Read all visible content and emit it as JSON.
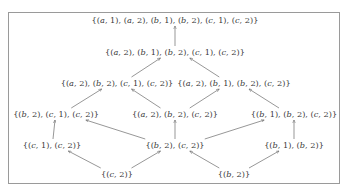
{
  "diagram": {
    "type": "hasse-lattice",
    "colors": {
      "text": "#3a3a3a",
      "edge": "#6a6a6a",
      "border": "#9a9a9a"
    },
    "nodes": [
      {
        "id": "n0",
        "label": "{(a, 1), (a, 2), (b, 1), (b, 2), (c, 1), (c, 2)}",
        "x": 175,
        "y": 20
      },
      {
        "id": "n1",
        "label": "{(a, 2), (b, 1), (b, 2), (c, 1), (c, 2)}",
        "x": 175,
        "y": 52
      },
      {
        "id": "n2",
        "label": "{(a, 2), (b, 2), (c, 1), (c, 2)}",
        "x": 117,
        "y": 83
      },
      {
        "id": "n3",
        "label": "{(a, 2), (b, 1), (b, 2), (c, 2)}",
        "x": 234,
        "y": 83
      },
      {
        "id": "n4",
        "label": "{(b, 2), (c, 1), (c, 2)}",
        "x": 56,
        "y": 114
      },
      {
        "id": "n5",
        "label": "{(a, 2), (b, 2), (c, 2)}",
        "x": 175,
        "y": 114
      },
      {
        "id": "n6",
        "label": "{(b, 1), (b, 2), (c, 2)}",
        "x": 294,
        "y": 114
      },
      {
        "id": "n7",
        "label": "{(c, 1), (c, 2)}",
        "x": 52,
        "y": 145
      },
      {
        "id": "n8",
        "label": "{(b, 2), (c, 2)}",
        "x": 175,
        "y": 145
      },
      {
        "id": "n9",
        "label": "{(b, 1), (b, 2)}",
        "x": 294,
        "y": 145
      },
      {
        "id": "n10",
        "label": "{(c, 2)}",
        "x": 117,
        "y": 174
      },
      {
        "id": "n11",
        "label": "{(b, 2)}",
        "x": 234,
        "y": 174
      }
    ],
    "edges": [
      {
        "from": "n1",
        "to": "n0"
      },
      {
        "from": "n2",
        "to": "n1"
      },
      {
        "from": "n3",
        "to": "n1"
      },
      {
        "from": "n4",
        "to": "n2"
      },
      {
        "from": "n5",
        "to": "n2"
      },
      {
        "from": "n5",
        "to": "n3"
      },
      {
        "from": "n6",
        "to": "n3"
      },
      {
        "from": "n7",
        "to": "n4"
      },
      {
        "from": "n8",
        "to": "n4"
      },
      {
        "from": "n8",
        "to": "n5"
      },
      {
        "from": "n8",
        "to": "n6"
      },
      {
        "from": "n9",
        "to": "n6"
      },
      {
        "from": "n10",
        "to": "n7"
      },
      {
        "from": "n10",
        "to": "n8"
      },
      {
        "from": "n11",
        "to": "n8"
      },
      {
        "from": "n11",
        "to": "n9"
      }
    ]
  }
}
